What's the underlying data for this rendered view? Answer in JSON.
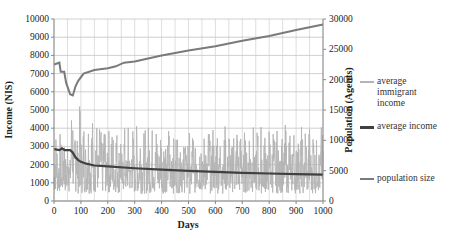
{
  "chart_data": {
    "type": "line",
    "title": "",
    "xlabel": "Days",
    "ylabel": "Income (NIS)",
    "y2label": "Population (Agents)",
    "xlim": [
      0,
      1000
    ],
    "ylim": [
      0,
      10000
    ],
    "y2lim": [
      0,
      30000
    ],
    "x_ticks": [
      "0",
      "100",
      "200",
      "300",
      "400",
      "500",
      "600",
      "700",
      "800",
      "900",
      "1000"
    ],
    "y_ticks": [
      "0",
      "1000",
      "2000",
      "3000",
      "4000",
      "5000",
      "6000",
      "7000",
      "8000",
      "9000",
      "10000"
    ],
    "y2_ticks": [
      "0",
      "5000",
      "10000",
      "15000",
      "20000",
      "25000",
      "30000"
    ],
    "grid": true,
    "legend_position": "right",
    "series": [
      {
        "name": "average immigrant income",
        "axis": "left",
        "color": "#b4b4b4",
        "style": "noisy oscillating line, roughly 300-5500 NIS, peak ~5800 near day 85",
        "x": [
          0,
          10,
          20,
          30,
          40,
          50,
          60,
          70,
          80,
          85,
          90,
          100,
          120,
          150,
          200,
          250,
          300,
          400,
          500,
          600,
          700,
          800,
          900,
          1000
        ],
        "values": [
          800,
          3500,
          500,
          3600,
          900,
          4000,
          700,
          5200,
          1500,
          5800,
          2500,
          4500,
          1200,
          4800,
          1000,
          4500,
          1200,
          4300,
          1000,
          4200,
          1100,
          4400,
          1000,
          3500
        ]
      },
      {
        "name": "average income",
        "axis": "left",
        "color": "#404040",
        "x": [
          0,
          20,
          30,
          40,
          60,
          70,
          80,
          90,
          100,
          120,
          150,
          200,
          300,
          400,
          500,
          600,
          700,
          800,
          900,
          1000
        ],
        "values": [
          2850,
          2800,
          2900,
          2800,
          2800,
          2650,
          2400,
          2250,
          2150,
          2050,
          1950,
          1900,
          1800,
          1720,
          1650,
          1600,
          1550,
          1510,
          1480,
          1450
        ]
      },
      {
        "name": "population size",
        "axis": "right",
        "color": "#7a7a7a",
        "x": [
          0,
          20,
          25,
          38,
          45,
          60,
          70,
          80,
          90,
          110,
          150,
          200,
          230,
          260,
          300,
          400,
          500,
          600,
          700,
          800,
          900,
          1000
        ],
        "values": [
          22500,
          22800,
          21300,
          21300,
          19500,
          17600,
          17400,
          18900,
          19800,
          21000,
          21600,
          21900,
          22200,
          22800,
          23000,
          24000,
          24800,
          25500,
          26400,
          27200,
          28200,
          29100
        ]
      }
    ]
  },
  "legend": {
    "items": [
      {
        "label_lines": [
          "average",
          "immigrant",
          "income"
        ],
        "color": "#b4b4b4"
      },
      {
        "label_lines": [
          "average income"
        ],
        "color": "#404040"
      },
      {
        "label_lines": [
          "population size"
        ],
        "color": "#7a7a7a"
      }
    ]
  },
  "axes": {
    "x_title": "Days",
    "y_title": "Income (NIS)",
    "y2_title": "Population (Agents)"
  }
}
